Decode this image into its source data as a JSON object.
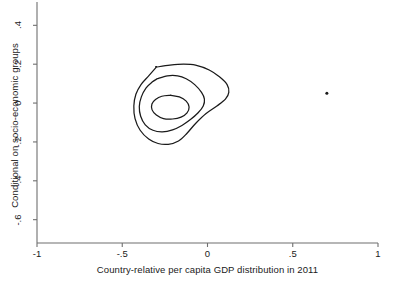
{
  "chart_data": {
    "type": "line",
    "subtype": "contour-density",
    "title": "",
    "xlabel": "Country-relative per capita GDP distribution in 2011",
    "ylabel": "Conditional on socio-economic groups",
    "xlim": [
      -1,
      1
    ],
    "ylim": [
      -0.72,
      0.52
    ],
    "xticks": [
      -1,
      -0.5,
      0,
      0.5,
      1
    ],
    "xtick_labels": [
      "-1",
      "-.5",
      "0",
      ".5",
      "1"
    ],
    "yticks": [
      0.4,
      0.2,
      0,
      -0.2,
      -0.4,
      -0.6
    ],
    "ytick_labels": [
      ".4",
      ".2",
      "0",
      "-.2",
      "-.4",
      "-.6"
    ],
    "grid": false,
    "legend": "none",
    "frame": "left-bottom",
    "line_color": "#1a1a1a",
    "background": "#ffffff",
    "contours": [
      {
        "name": "outer-contour",
        "level": 1,
        "points": [
          [
            -0.3,
            0.185
          ],
          [
            -0.22,
            0.195
          ],
          [
            -0.14,
            0.2
          ],
          [
            -0.07,
            0.195
          ],
          [
            0.01,
            0.17
          ],
          [
            0.07,
            0.135
          ],
          [
            0.115,
            0.095
          ],
          [
            0.125,
            0.055
          ],
          [
            0.105,
            0.02
          ],
          [
            0.055,
            -0.015
          ],
          [
            -0.01,
            -0.055
          ],
          [
            -0.07,
            -0.105
          ],
          [
            -0.12,
            -0.155
          ],
          [
            -0.17,
            -0.195
          ],
          [
            -0.23,
            -0.212
          ],
          [
            -0.29,
            -0.208
          ],
          [
            -0.345,
            -0.185
          ],
          [
            -0.395,
            -0.14
          ],
          [
            -0.425,
            -0.08
          ],
          [
            -0.432,
            -0.015
          ],
          [
            -0.42,
            0.045
          ],
          [
            -0.39,
            0.095
          ],
          [
            -0.345,
            0.14
          ],
          [
            -0.3,
            0.185
          ]
        ]
      },
      {
        "name": "middle-contour",
        "level": 2,
        "points": [
          [
            -0.295,
            0.125
          ],
          [
            -0.235,
            0.14
          ],
          [
            -0.175,
            0.14
          ],
          [
            -0.125,
            0.125
          ],
          [
            -0.075,
            0.095
          ],
          [
            -0.035,
            0.055
          ],
          [
            -0.018,
            0.02
          ],
          [
            -0.025,
            -0.015
          ],
          [
            -0.055,
            -0.05
          ],
          [
            -0.1,
            -0.085
          ],
          [
            -0.15,
            -0.115
          ],
          [
            -0.205,
            -0.138
          ],
          [
            -0.265,
            -0.148
          ],
          [
            -0.32,
            -0.14
          ],
          [
            -0.365,
            -0.112
          ],
          [
            -0.392,
            -0.068
          ],
          [
            -0.4,
            -0.018
          ],
          [
            -0.388,
            0.032
          ],
          [
            -0.36,
            0.078
          ],
          [
            -0.325,
            0.108
          ],
          [
            -0.295,
            0.125
          ]
        ]
      },
      {
        "name": "inner-contour",
        "level": 3,
        "points": [
          [
            -0.215,
            0.04
          ],
          [
            -0.165,
            0.032
          ],
          [
            -0.125,
            0.01
          ],
          [
            -0.108,
            -0.02
          ],
          [
            -0.12,
            -0.05
          ],
          [
            -0.155,
            -0.072
          ],
          [
            -0.205,
            -0.082
          ],
          [
            -0.258,
            -0.08
          ],
          [
            -0.3,
            -0.062
          ],
          [
            -0.325,
            -0.035
          ],
          [
            -0.326,
            -0.005
          ],
          [
            -0.305,
            0.018
          ],
          [
            -0.268,
            0.035
          ],
          [
            -0.215,
            0.04
          ]
        ]
      }
    ],
    "points": [
      {
        "name": "isolated-point",
        "x": 0.7,
        "y": 0.05
      }
    ]
  }
}
